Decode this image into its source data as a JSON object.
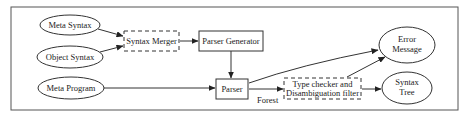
{
  "diagram": {
    "type": "flowchart",
    "nodes": {
      "meta_syntax": {
        "label": "Meta Syntax",
        "shape": "ellipse"
      },
      "object_syntax": {
        "label": "Object Syntax",
        "shape": "ellipse"
      },
      "meta_program": {
        "label": "Meta Program",
        "shape": "ellipse"
      },
      "syntax_merger": {
        "label": "Syntax Merger",
        "shape": "dashed-box"
      },
      "parser_generator": {
        "label": "Parser Generator",
        "shape": "box"
      },
      "parser": {
        "label": "Parser",
        "shape": "box"
      },
      "type_checker": {
        "label_line1": "Type checker and",
        "label_line2": "Disambiguation filter",
        "shape": "dashed-box"
      },
      "error_message": {
        "label_line1": "Error",
        "label_line2": "Message",
        "shape": "ellipse"
      },
      "syntax_tree": {
        "label_line1": "Syntax",
        "label_line2": "Tree",
        "shape": "ellipse"
      }
    },
    "edges": [
      {
        "from": "Meta Syntax",
        "to": "Syntax Merger"
      },
      {
        "from": "Object Syntax",
        "to": "Syntax Merger"
      },
      {
        "from": "Syntax Merger",
        "to": "Parser Generator"
      },
      {
        "from": "Parser Generator",
        "to": "Parser"
      },
      {
        "from": "Meta Program",
        "to": "Parser"
      },
      {
        "from": "Parser",
        "to": "Error Message"
      },
      {
        "from": "Parser",
        "to": "Type checker and Disambiguation filter",
        "label": "Forest"
      },
      {
        "from": "Type checker and Disambiguation filter",
        "to": "Error Message"
      },
      {
        "from": "Type checker and Disambiguation filter",
        "to": "Syntax Tree"
      }
    ],
    "edge_labels": {
      "forest": "Forest"
    }
  }
}
